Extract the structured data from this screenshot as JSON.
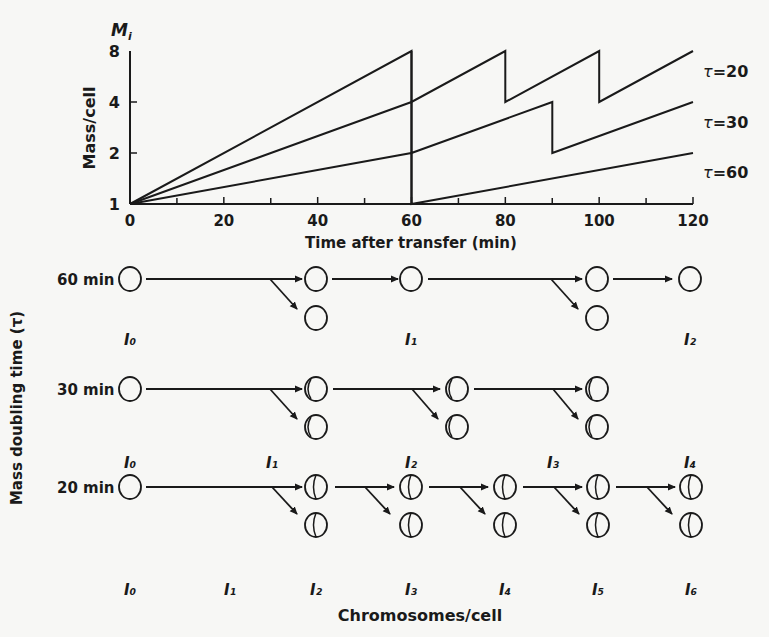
{
  "chart_data": {
    "type": "line",
    "title": "",
    "xlabel": "Time after transfer (min)",
    "ylabel": "Mass/cell",
    "ylabel_top": "M_i",
    "x_ticks": [
      0,
      20,
      40,
      60,
      80,
      100,
      120
    ],
    "x_minor_ticks": [
      10,
      30,
      50,
      70,
      90,
      110
    ],
    "y_ticks": [
      1,
      2,
      4,
      8
    ],
    "y_scale": "log2",
    "xlim": [
      0,
      120
    ],
    "ylim": [
      1,
      8
    ],
    "series": [
      {
        "name": "τ = 20",
        "label": "τ = 20",
        "points": [
          [
            0,
            1
          ],
          [
            60,
            8
          ],
          [
            60,
            4
          ],
          [
            80,
            8
          ],
          [
            80,
            4
          ],
          [
            100,
            8
          ],
          [
            100,
            4
          ],
          [
            120,
            8
          ]
        ]
      },
      {
        "name": "τ = 30",
        "label": "τ = 30",
        "points": [
          [
            0,
            1
          ],
          [
            60,
            4
          ],
          [
            60,
            2
          ],
          [
            90,
            4
          ],
          [
            90,
            2
          ],
          [
            120,
            4
          ]
        ]
      },
      {
        "name": "τ = 60",
        "label": "τ = 60",
        "points": [
          [
            0,
            1
          ],
          [
            60,
            2
          ],
          [
            60,
            1
          ],
          [
            120,
            2
          ]
        ]
      }
    ]
  },
  "chart": {
    "y_top_label": "M",
    "y_top_sub": "i",
    "ylabel": "Mass/cell",
    "xlabel": "Time after transfer (min)",
    "x_tick_labels": [
      "0",
      "20",
      "40",
      "60",
      "80",
      "100",
      "120"
    ],
    "y_tick_labels": [
      "1",
      "2",
      "4",
      "8"
    ],
    "legend": [
      {
        "tau": "τ",
        "eq": "=20"
      },
      {
        "tau": "τ",
        "eq": "=30"
      },
      {
        "tau": "τ",
        "eq": "=60"
      }
    ]
  },
  "diagram": {
    "ylabel": "Mass doubling time (τ)",
    "xlabel": "Chromosomes/cell",
    "rows": [
      {
        "label": "60 min",
        "sublabels": [
          "I₀",
          "I₁",
          "I₂"
        ]
      },
      {
        "label": "30 min",
        "sublabels": [
          "I₀",
          "I₁",
          "I₂",
          "I₃",
          "I₄"
        ]
      },
      {
        "label": "20 min",
        "sublabels": [
          "I₀",
          "I₁",
          "I₂",
          "I₃",
          "I₄",
          "I₅",
          "I₆"
        ]
      }
    ]
  }
}
